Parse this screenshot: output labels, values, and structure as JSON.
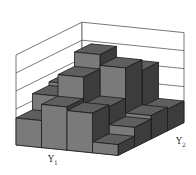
{
  "chart_data": {
    "type": "bar3d",
    "title": "",
    "xlabel": "Y1",
    "ylabel": "Y2",
    "zlabel": "",
    "x_categories": [
      1,
      2,
      3,
      4
    ],
    "y_categories": [
      1,
      2,
      3,
      4
    ],
    "grid": true,
    "zlim": [
      0,
      5
    ],
    "z_gridlines": 5,
    "values": [
      [
        1.5,
        2.4,
        2.2,
        0.6
      ],
      [
        2.4,
        3.6,
        2.1,
        1.1
      ],
      [
        2.6,
        4.4,
        3.8,
        1.3
      ],
      [
        1.2,
        3.0,
        3.2,
        1.2
      ]
    ],
    "values_note": "values[y2_index][y1_index]; heights estimated visually (no axis tick labels shown)"
  },
  "labels": {
    "y1_main": "Y",
    "y1_sub": "1",
    "y2_main": "Y",
    "y2_sub": "2"
  },
  "colors": {
    "bar_front": "#7a7a7a",
    "bar_top": "#5e5e5e",
    "bar_side": "#3c3c3c",
    "floor": "#a8a8a8",
    "wall": "#ffffff",
    "edge": "#1a1a1a",
    "gridline": "#444444"
  }
}
